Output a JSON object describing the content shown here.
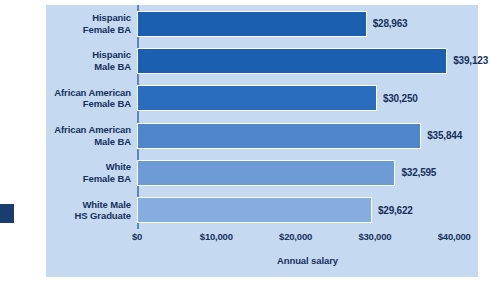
{
  "chart_data": {
    "type": "bar",
    "orientation": "horizontal",
    "title": "",
    "xlabel": "Annual salary",
    "ylabel": "",
    "xlim": [
      0,
      43000
    ],
    "xticks": [
      0,
      10000,
      20000,
      30000,
      40000
    ],
    "xtick_labels": [
      "$0",
      "$10,000",
      "$20,000",
      "$30,000",
      "$40,000"
    ],
    "grid": false,
    "legend": null,
    "categories": [
      "Hispanic\nFemale BA",
      "Hispanic\nMale BA",
      "African American\nFemale BA",
      "African American\nMale BA",
      "White\nFemale BA",
      "White Male\nHS Graduate"
    ],
    "values": [
      28963,
      39123,
      30250,
      35844,
      32595,
      29622
    ],
    "value_labels": [
      "$28,963",
      "$39,123",
      "$30,250",
      "$35,844",
      "$32,595",
      "$29,622"
    ],
    "bar_colors": [
      "#1b5fb0",
      "#1b5fb0",
      "#2a6cbd",
      "#4e85cb",
      "#6d9bd6",
      "#86add f"
    ]
  },
  "style": {
    "panel_background": "#c5d9f0",
    "page_background": "#ffffff",
    "text_color": "#16325c",
    "axis_color": "#5f86bb",
    "bar_border": "#ffffff",
    "edge_tab_color": "#1b3c6e"
  }
}
